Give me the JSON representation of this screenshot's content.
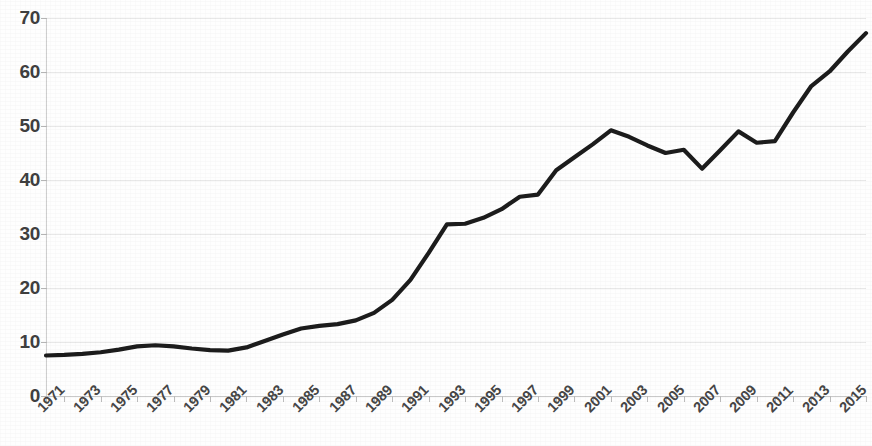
{
  "chart_data": {
    "type": "line",
    "title": "",
    "subtitle": "",
    "xlabel": "",
    "ylabel": "",
    "grid": true,
    "legend": false,
    "legend_position": "none",
    "line_color": "#1c1c1c",
    "grid_color": "#e8e8e8",
    "axis_color": "#c9c9c9",
    "tick_label_color": "#464646",
    "background_color": "#fefefe",
    "xlim": [
      1971,
      2016
    ],
    "ylim": [
      0,
      70
    ],
    "y_ticks": [
      0,
      10,
      20,
      30,
      40,
      50,
      60,
      70
    ],
    "y_tick_labels": [
      "0",
      "10",
      "20",
      "30",
      "40",
      "50",
      "60",
      "70"
    ],
    "x_tick_labels": [
      "1971",
      "1973",
      "1975",
      "1977",
      "1979",
      "1981",
      "1983",
      "1985",
      "1987",
      "1989",
      "1991",
      "1993",
      "1995",
      "1997",
      "1999",
      "2001",
      "2003",
      "2005",
      "2007",
      "2009",
      "2011",
      "2013",
      "2015"
    ],
    "x_tick_label_rotation": -45,
    "x": [
      1971,
      1972,
      1973,
      1974,
      1975,
      1976,
      1977,
      1978,
      1979,
      1980,
      1981,
      1982,
      1983,
      1984,
      1985,
      1986,
      1987,
      1988,
      1989,
      1990,
      1991,
      1992,
      1993,
      1994,
      1995,
      1996,
      1997,
      1998,
      1999,
      2000,
      2001,
      2002,
      2003,
      2004,
      2005,
      2006,
      2007,
      2008,
      2009,
      2010,
      2011,
      2012,
      2013,
      2014,
      2015,
      2016
    ],
    "values": [
      7.5,
      7.6,
      7.8,
      8.1,
      8.6,
      9.2,
      9.4,
      9.2,
      8.8,
      8.5,
      8.4,
      9.0,
      10.2,
      11.4,
      12.5,
      13.0,
      13.3,
      14.0,
      15.4,
      17.8,
      21.5,
      26.5,
      31.8,
      31.9,
      33.0,
      34.6,
      36.9,
      37.3,
      41.8,
      44.2,
      46.6,
      49.2,
      48.0,
      46.4,
      45.0,
      45.6,
      42.1,
      45.5,
      49.0,
      46.9,
      47.2,
      52.5,
      57.4,
      60.1,
      63.8,
      67.2
    ],
    "series": [
      {
        "name": "value",
        "values": [
          7.5,
          7.6,
          7.8,
          8.1,
          8.6,
          9.2,
          9.4,
          9.2,
          8.8,
          8.5,
          8.4,
          9.0,
          10.2,
          11.4,
          12.5,
          13.0,
          13.3,
          14.0,
          15.4,
          17.8,
          21.5,
          26.5,
          31.8,
          31.9,
          33.0,
          34.6,
          36.9,
          37.3,
          41.8,
          44.2,
          46.6,
          49.2,
          48.0,
          46.4,
          45.0,
          45.6,
          42.1,
          45.5,
          49.0,
          46.9,
          47.2,
          52.5,
          57.4,
          60.1,
          63.8,
          67.2
        ]
      }
    ]
  }
}
